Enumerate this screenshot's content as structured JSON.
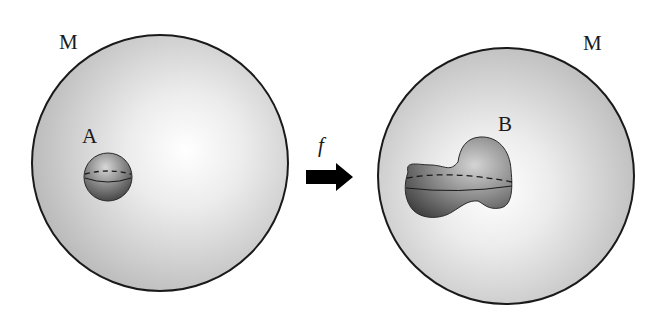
{
  "diagram": {
    "left": {
      "manifold_label": "M",
      "set_label": "A",
      "set_shape": "sphere"
    },
    "right": {
      "manifold_label": "M",
      "set_label": "B",
      "set_shape": "deformed blob (dumbbell-like)"
    },
    "map": {
      "label": "f",
      "direction": "left-to-right"
    }
  },
  "colors": {
    "outline": "#1a1a1a",
    "manifold_fill_light": "#ffffff",
    "manifold_fill_dark": "#b8b8b8",
    "set_fill_light": "#d0d0d0",
    "set_fill_dark": "#4a4a4a",
    "arrow": "#000000"
  }
}
